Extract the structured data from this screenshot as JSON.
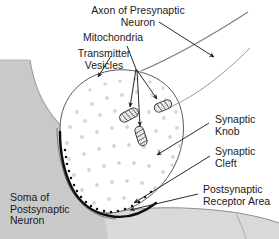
{
  "figure": {
    "type": "labeled-biological-diagram",
    "width": 279,
    "height": 239,
    "background_color": "#ffffff"
  },
  "labels": {
    "axon": {
      "line1": "Axon of Presynaptic",
      "line2": "Neuron"
    },
    "mitochondria": {
      "line1": "Mitochondria"
    },
    "transmitter_vesicles": {
      "line1": "Transmitter",
      "line2": "Vesicles"
    },
    "synaptic_knob": {
      "line1": "Synaptic",
      "line2": "Knob"
    },
    "synaptic_cleft": {
      "line1": "Synaptic",
      "line2": "Cleft"
    },
    "postsynaptic_receptor_area": {
      "line1": "Postsynaptic",
      "line2": "Receptor Area"
    },
    "soma": {
      "line1": "Soma of",
      "line2": "Postsynaptic",
      "line3": "Neuron"
    }
  },
  "colors": {
    "text": "#1a1a1a",
    "outline": "#3a3a3a",
    "leader_line": "#4a4a4a",
    "soma_fill": "#c9c9c9",
    "soma_edge": "#8a8a8a",
    "knob_fill": "#ffffff",
    "vesicle_fill": "#d4d4d4",
    "cleft_dark": "#111111",
    "receptor_band": "#d8d8d8"
  },
  "structures": {
    "soma_of_postsynaptic_neuron": "large gray body occupying the left edge and lower portion of the frame",
    "synaptic_knob": "large white oval terminal bulb filled with small gray transmitter vesicles",
    "transmitter_vesicles": "many small light-gray dots scattered inside the synaptic knob",
    "mitochondria": "three small stippled rod/bean shaped organelles with internal cristae inside the knob",
    "synaptic_cleft": "narrow dark gap between the base of the synaptic knob and the soma membrane",
    "postsynaptic_receptor_area": "dotted/stippled membrane region along the lower curve of the knob facing the soma",
    "axon": "slender process extending from the knob toward the upper right corner"
  },
  "mitochondria_positions": [
    {
      "cx": 129,
      "cy": 115,
      "angle": -28
    },
    {
      "cx": 163,
      "cy": 106,
      "angle": -22
    },
    {
      "cx": 141,
      "cy": 136,
      "angle": 72
    }
  ],
  "leader_lines": [
    {
      "label": "axon",
      "from": [
        159,
        22
      ],
      "to": [
        215,
        58
      ],
      "arrow": true
    },
    {
      "label": "mitochondria",
      "from": [
        127,
        46
      ],
      "to": [
        136,
        69
      ],
      "arrow": false
    },
    {
      "label": "transmitter_vesicles",
      "from": [
        111,
        56
      ],
      "to": [
        97,
        78
      ],
      "arrow": true
    },
    {
      "label": "synaptic_knob",
      "from": [
        209,
        123
      ],
      "to": [
        155,
        156
      ],
      "arrow": true
    },
    {
      "label": "synaptic_cleft",
      "from": [
        209,
        155
      ],
      "to": [
        133,
        204
      ],
      "arrow": true
    },
    {
      "label": "postsynaptic_receptor_area",
      "from": [
        198,
        194
      ],
      "to": [
        129,
        210
      ],
      "arrow": true
    }
  ]
}
